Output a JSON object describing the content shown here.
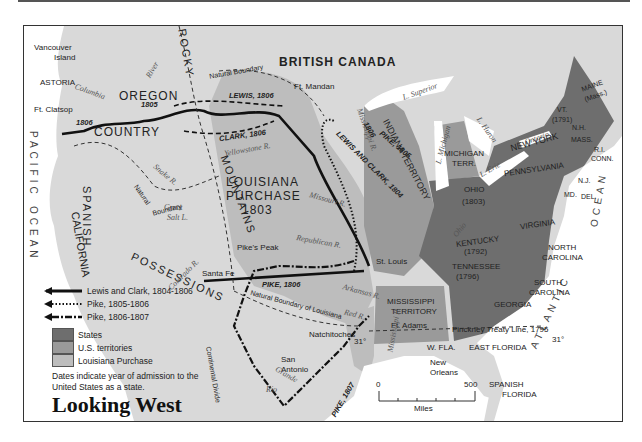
{
  "title": "Looking West",
  "legend": {
    "routes": [
      {
        "label": "Lewis and Clark, 1804-1806",
        "style": "solid"
      },
      {
        "label": "Pike, 1805-1806",
        "style": "dotted"
      },
      {
        "label": "Pike, 1806-1807",
        "style": "dash-dot"
      }
    ],
    "areas": [
      {
        "label": "States",
        "color": "#6e6e6e"
      },
      {
        "label": "U.S. territories",
        "color": "#9a9a9a"
      },
      {
        "label": "Louisiana Purchase",
        "color": "#bdbdbd"
      }
    ],
    "note": "Dates indicate year of admission to the United States as a state."
  },
  "scale": {
    "start": "0",
    "end": "500",
    "unit": "Miles"
  },
  "regions": {
    "british_canada": "BRITISH CANADA",
    "oregon": "OREGON",
    "country": "COUNTRY",
    "louisiana": "LOUISIANA",
    "purchase": "PURCHASE",
    "purchase_year": "1803",
    "spanish": "SPANISH",
    "possessions": "POSSESSIONS",
    "california": "CALIFORNIA",
    "rocky": "ROCKY",
    "mountains": "MOUNTAINS",
    "pacific": "PACIFIC",
    "ocean_w": "OCEAN",
    "atlantic": "ATLANTIC",
    "ocean_e": "OCEAN",
    "indiana_territory": "INDIANA TERRITORY",
    "michigan_terr_1": "MICHIGAN",
    "michigan_terr_2": "TERR.",
    "mississippi_territory_1": "MISSISSIPPI",
    "mississippi_territory_2": "TERRITORY",
    "spanish_florida_1": "SPANISH",
    "spanish_florida_2": "FLORIDA",
    "east_florida": "EAST FLORIDA",
    "west_florida": "W. FLA."
  },
  "states": {
    "maine": "MAINE",
    "maine_note": "(Mass.)",
    "vt": "VT.",
    "vt_year": "(1791)",
    "nh": "N.H.",
    "mass": "MASS.",
    "ri": "R.I.",
    "conn": "CONN.",
    "new_york": "NEW YORK",
    "pennsylvania": "PENNSYLVANIA",
    "nj": "N.J.",
    "del": "DEL.",
    "md": "MD.",
    "ohio": "OHIO",
    "ohio_year": "(1803)",
    "virginia": "VIRGINIA",
    "kentucky": "KENTUCKY",
    "kentucky_year": "(1792)",
    "tennessee": "TENNESSEE",
    "tennessee_year": "(1796)",
    "north_carolina_1": "NORTH",
    "north_carolina_2": "CAROLINA",
    "south_carolina_1": "SOUTH",
    "south_carolina_2": "CAROLINA",
    "georgia": "GEORGIA"
  },
  "places": {
    "vancouver_1": "Vancouver",
    "vancouver_2": "Island",
    "astoria": "ASTORIA",
    "ft_clatsop": "Ft. Clatsop",
    "ft_mandan": "Ft. Mandan",
    "pikes_peak": "Pike's Peak",
    "st_louis": "St. Louis",
    "santa_fe": "Santa Fe",
    "natchitoches": "Natchitoches",
    "ft_adams": "Ft. Adams",
    "san_antonio_1": "San",
    "san_antonio_2": "Antonio",
    "new_orleans_1": "New",
    "new_orleans_2": "Orleans"
  },
  "water": {
    "columbia": "Columbia",
    "river": "River",
    "snake": "Snake R.",
    "yellowstone": "Yellowstone R.",
    "missouri": "Missouri R.",
    "republican": "Republican R.",
    "arkansas": "Arkansas R.",
    "red": "Red R.",
    "colorado": "Colorado R.",
    "rio": "Rio",
    "grande": "Grande",
    "mississippi_n": "Mississippi R.",
    "mississippi_s": "Mississippi R.",
    "ohio": "Ohio",
    "great_salt_1": "Great",
    "great_salt_2": "Salt L.",
    "superior": "L. Superior",
    "michigan": "L. Michigan",
    "huron": "L. Huron",
    "erie": "L. Erie",
    "ontario": "L. Ontario"
  },
  "boundaries": {
    "natural_boundary_n": "Natural Boundary",
    "natural_boundary_w1": "Natural",
    "natural_boundary_w2": "Boundary",
    "natural_boundary_louisiana": "Natural Boundary of Louisiana",
    "continental_divide": "Continental Divide",
    "pinckney": "Pinckney Treaty Line, 1795",
    "lat_31_a": "31°",
    "lat_31_b": "31°"
  },
  "routes": {
    "oregon_1805": "1805",
    "oregon_1806": "1806",
    "lewis_1806": "LEWIS, 1806",
    "clark_1806": "CLARK, 1806",
    "lewis_clark_1804": "LEWIS AND CLARK, 1804",
    "pike_1805": "PIKE, 1805",
    "pike_1806_upper": "1806",
    "pike_1806": "PIKE, 1806",
    "pike_1807": "PIKE, 1807"
  },
  "colors": {
    "states": "#6e6e6e",
    "territories": "#9a9a9a",
    "louisiana": "#bdbdbd",
    "foreign_land": "#d9d9d9",
    "ocean": "#ffffff",
    "route": "#111111"
  }
}
